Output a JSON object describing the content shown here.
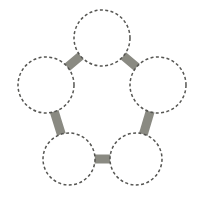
{
  "canvas": {
    "width": 204,
    "height": 202,
    "background": "#ffffff",
    "title": "pentagon-ring-diagram"
  },
  "style": {
    "node_stroke_color": "#555552",
    "node_fill_color": "#ffffff",
    "node_stroke_width": 1.5,
    "node_dash_pattern": "3 2.4",
    "edge_color": "#8a8a82",
    "edge_width": 9
  },
  "chart_data": {
    "type": "diagram",
    "layout": "pentagon-ring",
    "title": "",
    "node_count": 5,
    "edge_count": 5,
    "nodes": [
      {
        "id": "n1",
        "label": "",
        "cx": 102,
        "cy": 38,
        "r": 28,
        "position": "top"
      },
      {
        "id": "n2",
        "label": "",
        "cx": 158,
        "cy": 85,
        "r": 28,
        "position": "right"
      },
      {
        "id": "n3",
        "label": "",
        "cx": 136,
        "cy": 159,
        "r": 26,
        "position": "bottom-right"
      },
      {
        "id": "n4",
        "label": "",
        "cx": 69,
        "cy": 159,
        "r": 26,
        "position": "bottom-left"
      },
      {
        "id": "n5",
        "label": "",
        "cx": 46,
        "cy": 85,
        "r": 28,
        "position": "left"
      }
    ],
    "edges": [
      {
        "id": "e1",
        "from": "n1",
        "to": "n2",
        "label": ""
      },
      {
        "id": "e2",
        "from": "n2",
        "to": "n3",
        "label": ""
      },
      {
        "id": "e3",
        "from": "n3",
        "to": "n4",
        "label": ""
      },
      {
        "id": "e4",
        "from": "n4",
        "to": "n5",
        "label": ""
      },
      {
        "id": "e5",
        "from": "n5",
        "to": "n1",
        "label": ""
      }
    ]
  }
}
